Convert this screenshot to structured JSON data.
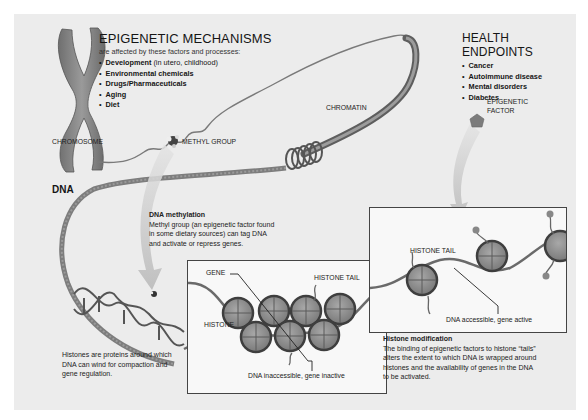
{
  "epigenetic_mechanisms": {
    "title": "EPIGENETIC MECHANISMS",
    "subtitle": "are affected by these factors and processes:",
    "items": [
      {
        "label": "Development",
        "note": " (in utero, childhood)"
      },
      {
        "label": "Environmental chemicals",
        "note": ""
      },
      {
        "label": "Drugs/Pharmaceuticals",
        "note": ""
      },
      {
        "label": "Aging",
        "note": ""
      },
      {
        "label": "Diet",
        "note": ""
      }
    ]
  },
  "health_endpoints": {
    "title": "HEALTH ENDPOINTS",
    "items": [
      "Cancer",
      "Autoimmune disease",
      "Mental disorders",
      "Diabetes"
    ]
  },
  "labels": {
    "chromosome": "CHROMOSOME",
    "chromatin": "CHROMATIN",
    "methyl_group": "METHYL GROUP",
    "epigenetic_factor_line1": "EPIGENETIC",
    "epigenetic_factor_line2": "FACTOR",
    "dna": "DNA",
    "gene": "GENE",
    "histone": "HISTONE",
    "histone_tail_inactive": "HISTONE TAIL",
    "histone_tail_active": "HISTONE TAIL",
    "dna_inaccessible": "DNA inaccessible, gene inactive",
    "dna_accessible": "DNA accessible, gene active"
  },
  "dna_methylation": {
    "title": "DNA methylation",
    "lines": [
      "Methyl group (an epigenetic factor found",
      "in some dietary sources) can tag DNA",
      "and activate or repress genes."
    ]
  },
  "histones_note": {
    "lines": [
      "Histones are proteins around which",
      "DNA can wind for compaction and",
      "gene regulation."
    ]
  },
  "histone_modification": {
    "title": "Histone modification",
    "lines": [
      "The binding of epigenetic factors to histone “tails”",
      "alters the extent to which DNA is wrapped around",
      "histones and the availability of genes in the DNA",
      "to be activated."
    ]
  },
  "colors": {
    "background": "#ececec",
    "panel": "#f8f8f8",
    "strand": "#6a6a6a",
    "histone": "#8e8e8e",
    "text": "#151515"
  }
}
